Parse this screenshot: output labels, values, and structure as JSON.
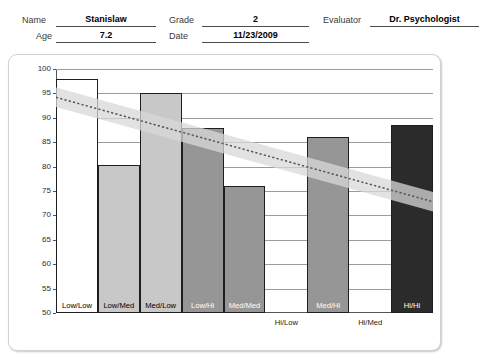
{
  "header": {
    "fields": [
      {
        "label": "Name",
        "value": "Stanislaw"
      },
      {
        "label": "Grade",
        "value": "2"
      },
      {
        "label": "Evaluator",
        "value": "Dr. Psychologist"
      },
      {
        "label": "Age",
        "value": "7.2"
      },
      {
        "label": "Date",
        "value": "11/23/2009"
      }
    ]
  },
  "chart_data": {
    "type": "bar",
    "title": "",
    "xlabel": "",
    "ylabel": "",
    "ylim": [
      50,
      100
    ],
    "ytick_step": 5,
    "yticks": [
      50,
      55,
      60,
      65,
      70,
      75,
      80,
      85,
      90,
      95,
      100
    ],
    "grid": true,
    "legend": "none",
    "categories": [
      "Low/Low",
      "Low/Med",
      "Med/Low",
      "Low/Hi",
      "Med/Med",
      "Hi/Low",
      "Med/Hi",
      "Hi/Med",
      "Hi/Hi"
    ],
    "values": [
      98,
      80.3,
      95,
      88,
      76,
      null,
      86,
      null,
      88.5
    ],
    "bar_colors": [
      "#ffffff",
      "#c8c8c8",
      "#c8c8c8",
      "#969696",
      "#969696",
      "none",
      "#969696",
      "none",
      "#2b2b2b"
    ],
    "bar_label_on_dark": [
      false,
      false,
      false,
      true,
      true,
      false,
      true,
      false,
      true
    ],
    "bar_label_below_axis": [
      false,
      false,
      false,
      false,
      false,
      true,
      false,
      true,
      false
    ],
    "trend_band": {
      "type": "confidence-band",
      "left_value": 94.2,
      "right_value": 72.8,
      "band_half_width": 2.0,
      "line_style": "dotted",
      "band_color": "#d8d8d8",
      "line_color": "#555555"
    }
  },
  "colors": {
    "axis": "#555555",
    "grid": "#9b9b9b",
    "bar_outline": "#1e1e1e",
    "panel_border": "#d2d2d2"
  }
}
